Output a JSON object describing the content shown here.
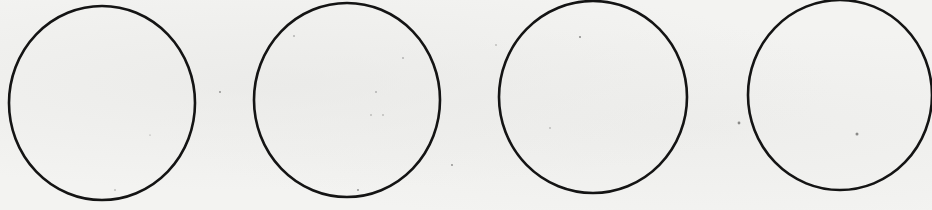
{
  "diagram": {
    "background_color": "#f3f3f1",
    "stroke_color": "#141414",
    "stroke_width": 2.6,
    "circles": [
      {
        "cx": 102,
        "cy": 103,
        "rx": 93,
        "ry": 97
      },
      {
        "cx": 347,
        "cy": 100,
        "rx": 93,
        "ry": 97
      },
      {
        "cx": 593,
        "cy": 97,
        "rx": 94,
        "ry": 96
      },
      {
        "cx": 840,
        "cy": 95,
        "rx": 92,
        "ry": 95
      }
    ],
    "specks": [
      {
        "x": 220,
        "y": 92,
        "r": 0.9
      },
      {
        "x": 294,
        "y": 36,
        "r": 0.8
      },
      {
        "x": 403,
        "y": 58,
        "r": 0.8
      },
      {
        "x": 376,
        "y": 92,
        "r": 0.8
      },
      {
        "x": 371,
        "y": 115,
        "r": 0.7
      },
      {
        "x": 383,
        "y": 115,
        "r": 0.7
      },
      {
        "x": 358,
        "y": 190,
        "r": 0.9
      },
      {
        "x": 452,
        "y": 165,
        "r": 0.9
      },
      {
        "x": 580,
        "y": 37,
        "r": 1.0
      },
      {
        "x": 550,
        "y": 128,
        "r": 0.7
      },
      {
        "x": 739,
        "y": 123,
        "r": 1.4
      },
      {
        "x": 857,
        "y": 134,
        "r": 1.5
      },
      {
        "x": 115,
        "y": 190,
        "r": 0.7
      },
      {
        "x": 150,
        "y": 135,
        "r": 0.6
      },
      {
        "x": 496,
        "y": 45,
        "r": 0.7
      }
    ]
  }
}
